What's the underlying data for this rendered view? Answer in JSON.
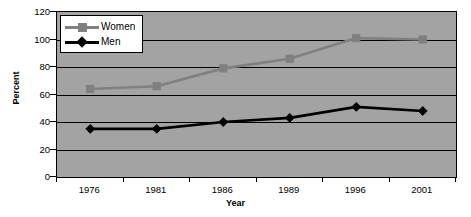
{
  "chart_data": {
    "type": "line",
    "title": "",
    "xlabel": "Year",
    "ylabel": "Percent",
    "categories": [
      "1976",
      "1981",
      "1986",
      "1989",
      "1996",
      "2001"
    ],
    "series": [
      {
        "name": "Women",
        "values": [
          64,
          66,
          79,
          86,
          101,
          100
        ],
        "color": "#808080",
        "marker": "square"
      },
      {
        "name": "Men",
        "values": [
          35,
          35,
          40,
          43,
          51,
          48
        ],
        "color": "#000000",
        "marker": "diamond"
      }
    ],
    "ylim": [
      0,
      120
    ],
    "yticks": [
      0,
      20,
      40,
      60,
      80,
      100,
      120
    ],
    "ytick_labels": [
      "0",
      "20",
      "40",
      "60",
      "80",
      "100",
      "120"
    ],
    "grid": true,
    "grid_axis": "y",
    "legend_position": "upper-left-inside",
    "plot_background": "#a3a3a3",
    "figure_background": "#ffffff",
    "axis_color": "#000000"
  },
  "legend": {
    "entries": [
      {
        "label": "Women"
      },
      {
        "label": "Men"
      }
    ]
  }
}
